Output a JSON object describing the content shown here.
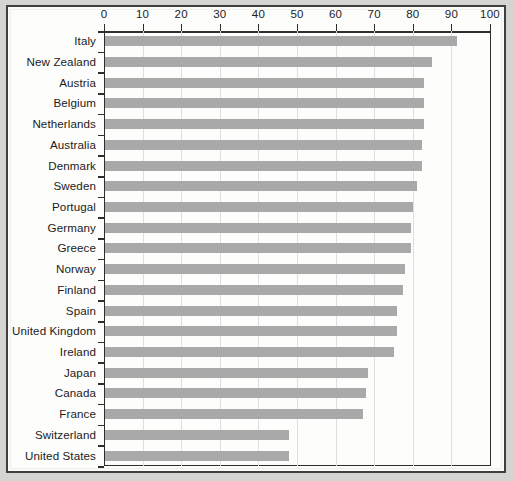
{
  "chart_data": {
    "type": "bar",
    "orientation": "horizontal",
    "title": "",
    "subtitle": "",
    "xlabel": "",
    "ylabel": "",
    "xlim": [
      0,
      100
    ],
    "xticks": [
      0,
      10,
      20,
      30,
      40,
      50,
      60,
      70,
      80,
      90,
      100
    ],
    "xtick_labels": [
      "0",
      "10",
      "20",
      "30",
      "40",
      "50",
      "60",
      "70",
      "80",
      "90",
      "100"
    ],
    "grid": true,
    "grid_axis": "x",
    "legend": false,
    "legend_position": "none",
    "bar_color": "#a9a9a9",
    "categories": [
      "Italy",
      "New Zealand",
      "Austria",
      "Belgium",
      "Netherlands",
      "Australia",
      "Denmark",
      "Sweden",
      "Portugal",
      "Germany",
      "Greece",
      "Norway",
      "Finland",
      "Spain",
      "United Kingdom",
      "Ireland",
      "Japan",
      "Canada",
      "France",
      "Switzerland",
      "United States"
    ],
    "values": [
      91.5,
      85,
      83,
      83,
      83,
      82.5,
      82.5,
      81,
      80,
      79.5,
      79.5,
      78,
      77.5,
      76,
      76,
      75,
      68.5,
      68,
      67,
      48,
      48
    ]
  },
  "axis": {
    "tick_labels": [
      "0",
      "10",
      "20",
      "30",
      "40",
      "50",
      "60",
      "70",
      "80",
      "90",
      "100"
    ]
  }
}
